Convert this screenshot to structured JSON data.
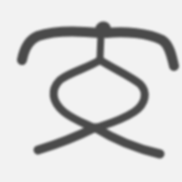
{
  "image": {
    "description": "Ancient script Chinese character glyph, dark strokes on light gray background",
    "glyph_label": "文",
    "colors": {
      "background": "#f2f2f2",
      "stroke": "#4a4a4a"
    }
  }
}
